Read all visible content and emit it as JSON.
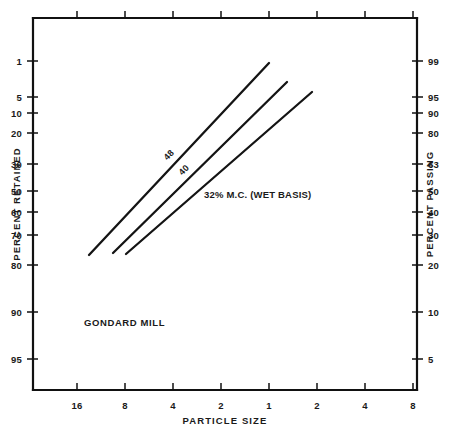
{
  "chart_data": {
    "type": "line",
    "title": "",
    "subtitle": "",
    "xlabel": "PARTICLE SIZE",
    "ylabel": "PERCENT RETAINED",
    "y2label": "PERCENT PASSING",
    "grid": false,
    "legend_position": "inline-labels",
    "annotations": [
      {
        "text": "GONDARD MILL",
        "x_px": 84,
        "y_px": 326,
        "rotation": 0
      }
    ],
    "x_axis": {
      "label": "PARTICLE SIZE",
      "tick_labels": [
        "16",
        "8",
        "4",
        "2",
        "1",
        "2",
        "4",
        "8"
      ],
      "tick_positions_px": [
        77,
        125,
        173,
        221,
        269,
        317,
        365,
        413
      ],
      "top_ticks": true,
      "top_tick_labels": []
    },
    "y_axis_left": {
      "label": "PERCENT RETAINED",
      "tick_labels": [
        "1",
        "5",
        "10",
        "20",
        "30",
        "50",
        "60",
        "70",
        "80",
        "90",
        "95"
      ],
      "tick_positions_px": [
        61,
        97,
        113,
        133,
        164,
        191,
        212,
        235,
        265,
        312,
        359
      ]
    },
    "y_axis_right": {
      "label": "PERCENT PASSING",
      "tick_labels": [
        "99",
        "95",
        "90",
        "80",
        "63",
        "50",
        "40",
        "30",
        "20",
        "10",
        "5"
      ],
      "tick_positions_px": [
        61,
        97,
        113,
        133,
        164,
        191,
        212,
        235,
        265,
        312,
        359
      ]
    },
    "series": [
      {
        "name": "48",
        "label": "48",
        "label_rotation": -45,
        "label_x_px": 171,
        "label_y_px": 157,
        "points_px": [
          [
            89,
            255
          ],
          [
            269,
            63
          ]
        ],
        "data": [
          {
            "particle_size": "13",
            "percent_retained": 81,
            "percent_passing": 19
          },
          {
            "particle_size": "1.0",
            "percent_retained": 3,
            "percent_passing": 97
          }
        ]
      },
      {
        "name": "40",
        "label": "40",
        "label_rotation": -45,
        "label_x_px": 186,
        "label_y_px": 172,
        "points_px": [
          [
            113,
            253
          ],
          [
            287,
            82
          ]
        ],
        "data": [
          {
            "particle_size": "9",
            "percent_retained": 80,
            "percent_passing": 20
          },
          {
            "particle_size": "0.75",
            "percent_retained": 7,
            "percent_passing": 93
          }
        ]
      },
      {
        "name": "32% M.C. (WET BASIS)",
        "label": "32% M.C. (WET BASIS)",
        "label_rotation": 0,
        "label_x_px": 204,
        "label_y_px": 198,
        "points_px": [
          [
            126,
            254
          ],
          [
            312,
            92
          ]
        ],
        "data": [
          {
            "particle_size": "8",
            "percent_retained": 80,
            "percent_passing": 20
          },
          {
            "particle_size": "0.55",
            "percent_retained": 10,
            "percent_passing": 90
          }
        ]
      }
    ],
    "frame": {
      "left_px": 33,
      "right_px": 417,
      "top_px": 18,
      "bottom_px": 390
    },
    "colors": {
      "line": "#141414",
      "axis": "#111111",
      "text": "#1a1a1a",
      "background": "#ffffff"
    }
  }
}
